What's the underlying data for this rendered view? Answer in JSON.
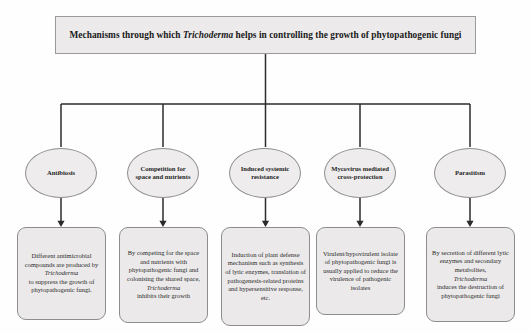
{
  "diagram": {
    "title_pre": "Mechanisms through which ",
    "title_italic": "Trichoderma",
    "title_post": " helps in controlling the growth of phytopathogenic fungi",
    "title_full": "Mechanisms through which Trichoderma helps in controlling the growth of phytopathogenic fungi",
    "colors": {
      "node_fill": "#ebe9e9",
      "node_border": "#8d8d8d",
      "title_fill": "#eceaea",
      "connector": "#2b2b2b",
      "text": "#2a2a2a",
      "background": "#fefefe"
    },
    "nodes": [
      {
        "id": "antibiosis",
        "label": "Antibiosis",
        "detail_pre": "Different antimicrobial compounds are produced by ",
        "detail_italic": "Trichoderma",
        "detail_post": " to suppress the growth of phytopathogenic fungi.",
        "detail_full": "Different antimicrobial compounds are produced by Trichoderma to suppress the growth of phytopathogenic fungi."
      },
      {
        "id": "competition",
        "label": "Competition for space and nutrients",
        "detail_pre": "By competing for the space and nutrients with phytopathogenic fungi and colonising the shared space, ",
        "detail_italic": "Trichoderma",
        "detail_post": " inhibits their growth",
        "detail_full": "By competing for the space and nutrients with phytopathogenic fungi and colonising the shared space, Trichoderma inhibits their growth"
      },
      {
        "id": "induced-systemic-resistance",
        "label": "Induced systemic resistance",
        "detail_pre": "Induction of plant defense mechanism such as synthesis of lytic enzymes, translation of pathogenesis-related proteins and hypersensitive response, etc.",
        "detail_italic": "",
        "detail_post": "",
        "detail_full": "Induction of plant defense mechanism such as synthesis of lytic enzymes, translation of pathogenesis-related proteins and hypersensitive response, etc."
      },
      {
        "id": "mycovirus-mediated-cross-protection",
        "label": "Mycovirus mediated cross-protection",
        "detail_pre": "Virulent/hypovirulent isolate of phytopathogenic fungi is usually applied to reduce the virulence of pathogenic isolates",
        "detail_italic": "",
        "detail_post": "",
        "detail_full": "Virulent/hypovirulent isolate of phytopathogenic fungi is usually applied to reduce the virulence of pathogenic isolates"
      },
      {
        "id": "parasitism",
        "label": "Parasitism",
        "detail_pre": "By secretion of different lytic enzymes and secondary metabolites, ",
        "detail_italic": "Trichoderma",
        "detail_post": " induces the destruction of phytopathogenic fungi",
        "detail_full": "By secretion of different lytic enzymes and secondary metabolites, Trichoderma induces the destruction of phytopathogenic fungi"
      }
    ]
  }
}
